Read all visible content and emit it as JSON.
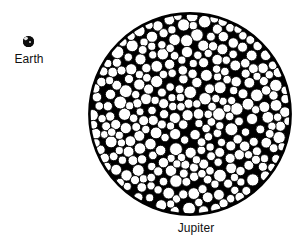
{
  "figure": {
    "type": "scientific-size-comparison-diagram",
    "background_color": "#ffffff",
    "ink_color": "#000000",
    "caption_font_size_px": 12
  },
  "earth": {
    "label": "Earth",
    "icon": "earth-globe-icon",
    "diameter_px": 11,
    "center_px": [
      22,
      45
    ],
    "fill_color": "#0d0d0d",
    "highlight_color": "#e9e9e9"
  },
  "jupiter": {
    "label": "Jupiter",
    "icon": "jupiter-disc-icon",
    "center_px": [
      190,
      114
    ],
    "radius_px": 102,
    "rim_color": "#000000",
    "packed_circle_fill": "#ffffff",
    "packed_circle_stroke": "#000000",
    "packed_circle_count": 369,
    "packed_circle_diameter_range_px": [
      8,
      13
    ]
  },
  "chart_data": {
    "type": "scatter",
    "title": "",
    "xlabel": "",
    "ylabel": "",
    "annotations": [
      "Earth",
      "Jupiter"
    ],
    "legend": [],
    "grid": false,
    "series": [
      {
        "name": "Earth",
        "values": [
          1
        ],
        "radius_px": 5.5,
        "center": [
          22,
          45
        ]
      },
      {
        "name": "Jupiter",
        "values": [
          102
        ],
        "radius_px": 102,
        "center": [
          190,
          114
        ]
      }
    ],
    "note": "Jupiter disc is tiled with many Earth-sized circles to show relative volume."
  }
}
